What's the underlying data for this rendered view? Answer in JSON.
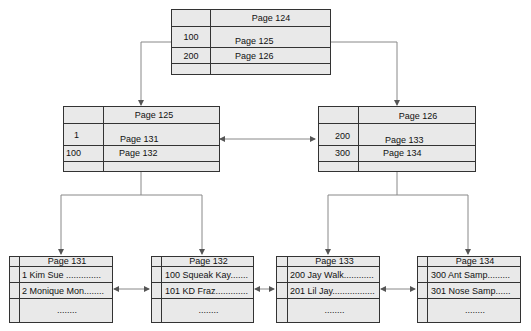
{
  "diagram": {
    "type": "b-tree-index",
    "colors": {
      "box_fill": "#e9e9e9",
      "border": "#333333",
      "connector": "#888888"
    },
    "root": {
      "header": "Page 124",
      "rows": [
        {
          "key": "100",
          "pointer": "Page 125"
        },
        {
          "key": "200",
          "pointer": "Page 126"
        }
      ]
    },
    "intermediate": [
      {
        "header": "Page 125",
        "rows": [
          {
            "key": "1",
            "pointer": "Page 131"
          },
          {
            "key": "100",
            "pointer": "Page 132"
          }
        ]
      },
      {
        "header": "Page 126",
        "rows": [
          {
            "key": "200",
            "pointer": "Page 133"
          },
          {
            "key": "300",
            "pointer": "Page 134"
          }
        ]
      }
    ],
    "leaves": [
      {
        "header": "Page 131",
        "rows": [
          "1 Kim Sue ..............",
          "2 Monique Mon........"
        ],
        "more": "........"
      },
      {
        "header": "Page 132",
        "rows": [
          "100 Squeak Kay.......",
          "101 KD Fraz............."
        ],
        "more": "........"
      },
      {
        "header": "Page 133",
        "rows": [
          "200 Jay Walk............",
          "201 Lil Jay................."
        ],
        "more": "........"
      },
      {
        "header": "Page 134",
        "rows": [
          "300 Ant Samp.........",
          "301 Nose Samp......"
        ],
        "more": "........"
      }
    ]
  }
}
